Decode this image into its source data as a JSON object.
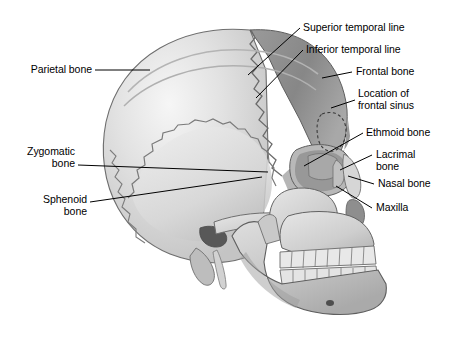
{
  "figure": {
    "background_color": "#ffffff",
    "text_color": "#000000",
    "leader_line_color": "#000000"
  },
  "labels": {
    "parietal_bone": "Parietal bone",
    "zygomatic_bone_l1": "Zygomatic",
    "zygomatic_bone_l2": "bone",
    "sphenoid_bone_l1": "Sphenoid",
    "sphenoid_bone_l2": "bone",
    "superior_temporal_line": "Superior temporal line",
    "inferior_temporal_line": "Inferior temporal line",
    "frontal_bone": "Frontal bone",
    "location_of_frontal_sinus_l1": "Location of",
    "location_of_frontal_sinus_l2": "frontal sinus",
    "ethmoid_bone": "Ethmoid bone",
    "lacrimal_bone_l1": "Lacrimal",
    "lacrimal_bone_l2": "bone",
    "nasal_bone": "Nasal bone",
    "maxilla": "Maxilla"
  },
  "anatomy": {
    "regions": [
      "parietal-bone",
      "frontal-bone",
      "temporal-bone",
      "sphenoid-bone",
      "zygomatic-bone",
      "ethmoid-bone",
      "lacrimal-bone",
      "nasal-bone",
      "maxilla",
      "mandible",
      "orbit",
      "teeth"
    ],
    "shading": {
      "parietal_light": "#dcdcdc",
      "parietal_highlight": "#f2f2f2",
      "frontal_dark": "#8c8c8c",
      "frontal_mid": "#a6a6a6",
      "face_light": "#d2d2d2",
      "mandible": "#c8c8c8",
      "orbit_shadow": "#4a4a4a",
      "suture": "#6b6b6b",
      "outline": "#4f4f4f",
      "tooth": "#ededed"
    }
  }
}
